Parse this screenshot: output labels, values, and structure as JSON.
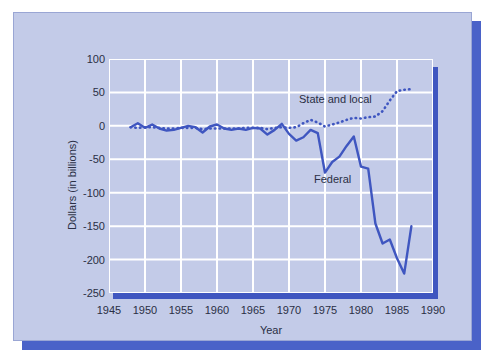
{
  "chart_data": {
    "type": "line",
    "title": "",
    "xlabel": "Year",
    "ylabel": "Dollars (in billions)",
    "xlim": [
      1945,
      1990
    ],
    "ylim": [
      -250,
      100
    ],
    "xticks": [
      1945,
      1950,
      1955,
      1960,
      1965,
      1970,
      1975,
      1980,
      1985,
      1990
    ],
    "yticks": [
      100,
      50,
      0,
      -50,
      -100,
      -150,
      -200,
      -250
    ],
    "grid": true,
    "legend_position": "inline-annotation",
    "colors": {
      "plot_background": "#c3cbe8",
      "card_background": "#c3cbe8",
      "gridline": "#ffffff",
      "series_line": "#3f56c0",
      "shadow": "#4a62c8",
      "text": "#2a2f45"
    },
    "annotations": [
      {
        "text": "State and local",
        "x": 1972,
        "y": 18
      },
      {
        "text": "Federal",
        "x": 1974,
        "y": -95
      }
    ],
    "series": [
      {
        "name": "Federal",
        "style": "solid",
        "x": [
          1948,
          1949,
          1950,
          1951,
          1952,
          1953,
          1954,
          1955,
          1956,
          1957,
          1958,
          1959,
          1960,
          1961,
          1962,
          1963,
          1964,
          1965,
          1966,
          1967,
          1968,
          1969,
          1970,
          1971,
          1972,
          1973,
          1974,
          1975,
          1976,
          1977,
          1978,
          1979,
          1980,
          1981,
          1982,
          1983,
          1984,
          1985,
          1986,
          1987
        ],
        "values": [
          -2,
          4,
          -3,
          2,
          -4,
          -7,
          -6,
          -3,
          0,
          -2,
          -10,
          -1,
          2,
          -4,
          -6,
          -4,
          -6,
          -3,
          -4,
          -13,
          -6,
          3,
          -12,
          -22,
          -17,
          -6,
          -11,
          -70,
          -54,
          -46,
          -30,
          -16,
          -61,
          -64,
          -146,
          -176,
          -170,
          -198,
          -221,
          -150
        ]
      },
      {
        "name": "State and local",
        "style": "dotted",
        "x": [
          1948,
          1949,
          1950,
          1951,
          1952,
          1953,
          1954,
          1955,
          1956,
          1957,
          1958,
          1959,
          1960,
          1961,
          1962,
          1963,
          1964,
          1965,
          1966,
          1967,
          1968,
          1969,
          1970,
          1971,
          1972,
          1973,
          1974,
          1975,
          1976,
          1977,
          1978,
          1979,
          1980,
          1981,
          1982,
          1983,
          1984,
          1985,
          1986,
          1987
        ],
        "values": [
          -2,
          -3,
          -2,
          -2,
          -3,
          -4,
          -4,
          -3,
          -3,
          -3,
          -5,
          -4,
          -4,
          -4,
          -4,
          -4,
          -3,
          -3,
          -3,
          -5,
          -3,
          -2,
          -3,
          -2,
          4,
          9,
          5,
          -1,
          2,
          5,
          9,
          12,
          11,
          13,
          14,
          22,
          38,
          52,
          54,
          55
        ]
      }
    ]
  },
  "axis": {
    "y_title": "Dollars (in billions)",
    "x_title": "Year",
    "y_tick_labels": [
      "100",
      "50",
      "0",
      "-50",
      "-100",
      "-150",
      "-200",
      "-250"
    ],
    "x_tick_labels": [
      "1945",
      "1950",
      "1955",
      "1960",
      "1965",
      "1970",
      "1975",
      "1980",
      "1985",
      "1990"
    ]
  },
  "labels": {
    "state_and_local": "State and local",
    "federal": "Federal"
  }
}
